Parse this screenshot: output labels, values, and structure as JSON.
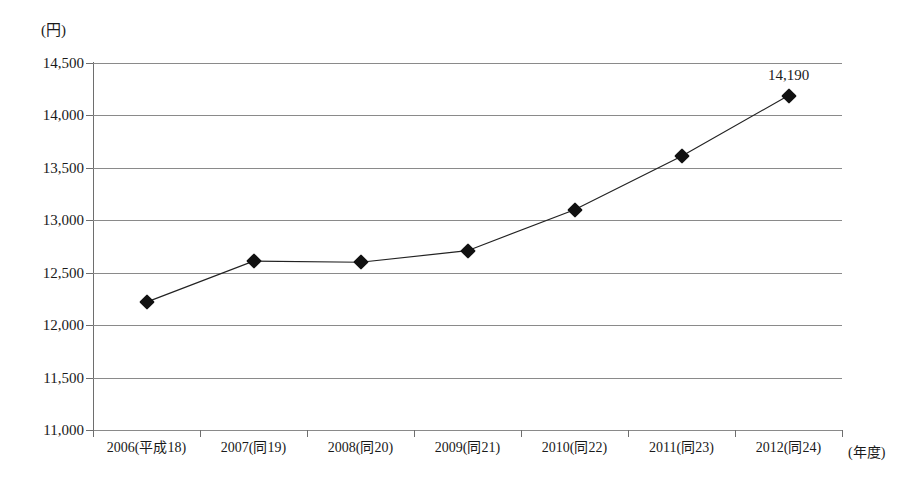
{
  "chart_data": {
    "type": "line",
    "title": "",
    "subtitle": "",
    "xlabel": "(年度)",
    "ylabel": "(円)",
    "ylim": [
      11000,
      14500
    ],
    "ytick_step": 500,
    "grid": true,
    "legend": "none",
    "marker": "diamond",
    "categories": [
      "2006(平成18)",
      "2007(同19)",
      "2008(同20)",
      "2009(同21)",
      "2010(同22)",
      "2011(同23)",
      "2012(同24)"
    ],
    "values": [
      12220,
      12610,
      12600,
      12710,
      13100,
      13610,
      14190
    ],
    "ytick_labels": [
      "14,500",
      "14,000",
      "13,500",
      "13,000",
      "12,500",
      "12,000",
      "11,500",
      "11,000"
    ],
    "ytick_values": [
      14500,
      14000,
      13500,
      13000,
      12500,
      12000,
      11500,
      11000
    ],
    "point_labels": [
      {
        "index": 6,
        "text": "14,190"
      }
    ],
    "colors": {
      "line": "#222222",
      "marker": "#111111",
      "grid": "#8a8a8a",
      "axis": "#6e6e6e",
      "text": "#1a1a1a",
      "background": "#ffffff"
    }
  }
}
